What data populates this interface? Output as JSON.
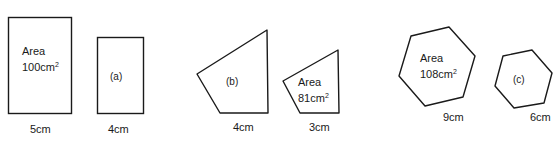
{
  "figure": {
    "groups": [
      {
        "name": "rectangles",
        "large": {
          "shape": "rectangle",
          "area_label": "Area",
          "area_value": "100cm",
          "area_unit_power": "2",
          "dimension": "5cm"
        },
        "small": {
          "shape": "rectangle",
          "label": "(a)",
          "dimension": "4cm"
        }
      },
      {
        "name": "quadrilaterals",
        "large": {
          "shape": "quadrilateral",
          "label": "(b)",
          "dimension": "4cm"
        },
        "small": {
          "shape": "quadrilateral",
          "area_label": "Area",
          "area_value": "81cm",
          "area_unit_power": "2",
          "dimension": "3cm"
        }
      },
      {
        "name": "hexagons",
        "large": {
          "shape": "hexagon",
          "area_label": "Area",
          "area_value": "108cm",
          "area_unit_power": "2",
          "dimension": "9cm"
        },
        "small": {
          "shape": "hexagon",
          "label": "(c)",
          "dimension": "6cm"
        }
      }
    ],
    "stroke_color": "#1a1a1a",
    "background_color": "#ffffff"
  }
}
